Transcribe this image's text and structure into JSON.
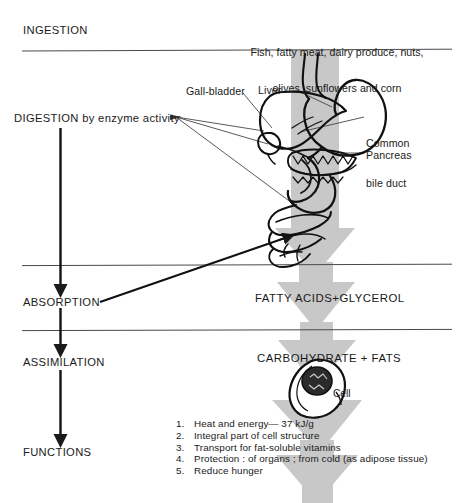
{
  "diagram": {
    "colors": {
      "ink": "#1a1a1a",
      "gray_arrow": "#c6c6c6",
      "divider": "#555555",
      "background": "#ffffff"
    }
  },
  "stages": {
    "ingestion": "INGESTION",
    "digestion": "DIGESTION by enzyme activity",
    "absorption": "ABSORPTION",
    "assimilation": "ASSIMILATION",
    "functions": "FUNCTIONS"
  },
  "food_sources": {
    "line1": "Fish, fatty meat, dairy produce, nuts,",
    "line2": "olives, sunflowers and corn"
  },
  "organ_labels": {
    "gall_bladder": "Gall-bladder",
    "liver": "Liver",
    "common_bile_duct_line1": "Common",
    "common_bile_duct_line2": "bile duct",
    "pancreas": "Pancreas",
    "cell": "Cell"
  },
  "products": {
    "absorption_products": "FATTY ACIDS+GLYCEROL",
    "assimilation_products": "CARBOHYDRATE + FATS"
  },
  "functions_list": [
    {
      "num": "1.",
      "text": "Heat and energy—8212 37 kJ/g"
    },
    {
      "num": "2.",
      "text": "Integral part of cell structure"
    },
    {
      "num": "3.",
      "text": "Transport for fat-soluble vitamins"
    },
    {
      "num": "4.",
      "text": "Protection : of organs ; from cold  (as adipose tissue)"
    },
    {
      "num": "5.",
      "text": "Reduce hunger"
    }
  ],
  "functions_list_display": [
    "Heat and energy— 37 kJ/g",
    "Integral part of cell structure",
    "Transport for fat-soluble vitamins",
    "Protection : of organs ; from cold  (as adipose tissue)",
    "Reduce hunger"
  ],
  "icons": {
    "down_arrow": "down-arrow-icon",
    "gray_flow_arrow": "gray-flow-arrow-icon",
    "leader_line": "leader-line-icon"
  }
}
